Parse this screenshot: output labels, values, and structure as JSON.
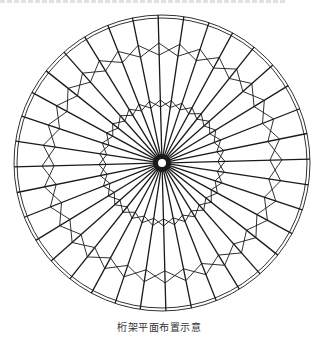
{
  "figure": {
    "caption": "桁架平面布置示意",
    "colors": {
      "line": "#1a1a1a",
      "background": "#ffffff"
    },
    "geometry": {
      "center": [
        162,
        163
      ],
      "spoke_count": 36,
      "rotation_deg": -1.5,
      "outer_ring_radii": [
        145,
        148
      ],
      "hub": {
        "outer_radius": 9,
        "hole_radius": 4
      },
      "outer_band": {
        "inner_radius": 108,
        "outer_radius": 120
      },
      "inner_band": {
        "inner_radius": 56,
        "outer_radius": 63
      }
    }
  }
}
